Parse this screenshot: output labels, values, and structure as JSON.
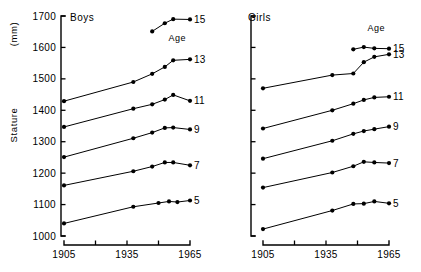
{
  "chart_data": {
    "type": "line",
    "title": "",
    "xlabel": "",
    "ylabel": "Stature",
    "yunit": "(mm)",
    "ylim": [
      1000,
      1700
    ],
    "xlim": [
      1905,
      1965
    ],
    "grid": false,
    "legend_position": "right-of-series",
    "legend_caption": "Age",
    "y_ticks": [
      1700,
      1600,
      1500,
      1400,
      1300,
      1200,
      1100,
      1000
    ],
    "y_tick_labels": [
      "1700",
      "1600",
      "1500",
      "1400",
      "1300",
      "1200",
      "1100",
      "1000"
    ],
    "x_ticks": [
      1905,
      1920,
      1935,
      1950,
      1965
    ],
    "x_tick_labels": [
      "1905",
      "",
      "1935",
      "",
      "1965"
    ],
    "x_tick_labels_visible": [
      "1905",
      "1935",
      "1965"
    ],
    "panels": [
      {
        "name": "boys",
        "title": "Boys",
        "series": [
          {
            "name": "Age 5",
            "label": "5",
            "x": [
              1905,
              1938,
              1950,
              1955,
              1959,
              1965
            ],
            "values": [
              1040,
              1093,
              1105,
              1110,
              1108,
              1113
            ]
          },
          {
            "name": "Age 7",
            "label": "7",
            "x": [
              1905,
              1938,
              1947,
              1953,
              1957,
              1965
            ],
            "values": [
              1161,
              1206,
              1221,
              1234,
              1234,
              1225
            ]
          },
          {
            "name": "Age 9",
            "label": "9",
            "x": [
              1905,
              1938,
              1947,
              1953,
              1957,
              1965
            ],
            "values": [
              1251,
              1311,
              1329,
              1344,
              1345,
              1339
            ]
          },
          {
            "name": "Age 11",
            "label": "11",
            "x": [
              1905,
              1938,
              1947,
              1953,
              1957,
              1965
            ],
            "values": [
              1347,
              1405,
              1419,
              1434,
              1449,
              1430
            ]
          },
          {
            "name": "Age 13",
            "label": "13",
            "x": [
              1905,
              1938,
              1947,
              1953,
              1957,
              1965
            ],
            "values": [
              1429,
              1490,
              1516,
              1538,
              1559,
              1562
            ]
          },
          {
            "name": "Age 15",
            "label": "15",
            "x": [
              1947,
              1953,
              1957,
              1965
            ],
            "values": [
              1651,
              1677,
              1690,
              1689
            ]
          }
        ]
      },
      {
        "name": "girls",
        "title": "Girls",
        "series": [
          {
            "name": "Age 5",
            "label": "5",
            "x": [
              1905,
              1938,
              1948,
              1953,
              1958,
              1965
            ],
            "values": [
              1022,
              1081,
              1102,
              1103,
              1110,
              1104
            ]
          },
          {
            "name": "Age 7",
            "label": "7",
            "x": [
              1905,
              1938,
              1948,
              1953,
              1958,
              1965
            ],
            "values": [
              1154,
              1202,
              1222,
              1236,
              1234,
              1232
            ]
          },
          {
            "name": "Age 9",
            "label": "9",
            "x": [
              1905,
              1938,
              1948,
              1953,
              1958,
              1965
            ],
            "values": [
              1246,
              1303,
              1325,
              1334,
              1340,
              1348
            ]
          },
          {
            "name": "Age 11",
            "label": "11",
            "x": [
              1905,
              1938,
              1948,
              1953,
              1958,
              1965
            ],
            "values": [
              1342,
              1400,
              1421,
              1433,
              1441,
              1443
            ]
          },
          {
            "name": "Age 13",
            "label": "13",
            "x": [
              1905,
              1938,
              1948,
              1953,
              1958,
              1965
            ],
            "values": [
              1470,
              1512,
              1517,
              1553,
              1570,
              1578
            ]
          },
          {
            "name": "Age 15",
            "label": "15",
            "x": [
              1948,
              1953,
              1958,
              1965
            ],
            "values": [
              1594,
              1601,
              1597,
              1596
            ]
          }
        ]
      }
    ]
  }
}
